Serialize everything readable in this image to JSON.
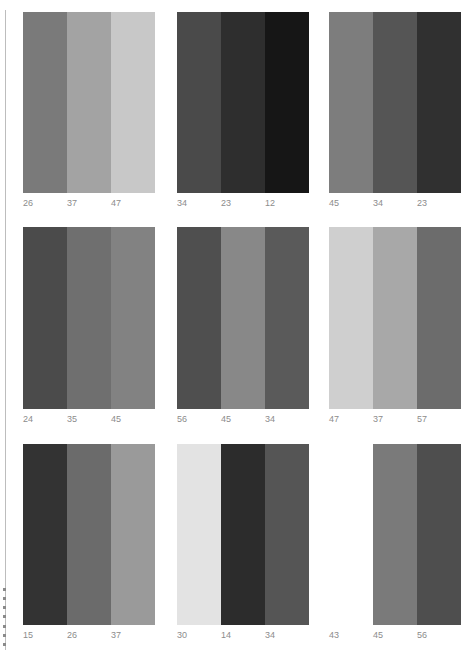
{
  "page": {
    "side_marker": "vertical page tab marker"
  },
  "rows": [
    {
      "panels": [
        {
          "colors": [
            "#7a7a7a",
            "#a3a3a3",
            "#c8c8c8"
          ],
          "labels": [
            "26",
            "37",
            "47"
          ]
        },
        {
          "colors": [
            "#4a4a4a",
            "#2e2e2e",
            "#161616"
          ],
          "labels": [
            "34",
            "23",
            "12"
          ]
        },
        {
          "colors": [
            "#7d7d7d",
            "#555555",
            "#303030"
          ],
          "labels": [
            "45",
            "34",
            "23"
          ]
        }
      ]
    },
    {
      "panels": [
        {
          "colors": [
            "#4b4b4b",
            "#6f6f6f",
            "#828282"
          ],
          "labels": [
            "24",
            "35",
            "45"
          ]
        },
        {
          "colors": [
            "#4f4f4f",
            "#888888",
            "#5a5a5a"
          ],
          "labels": [
            "56",
            "45",
            "34"
          ]
        },
        {
          "colors": [
            "#cfcfcf",
            "#a8a8a8",
            "#6c6c6c"
          ],
          "labels": [
            "47",
            "37",
            "57"
          ]
        }
      ]
    },
    {
      "panels": [
        {
          "colors": [
            "#333333",
            "#6b6b6b",
            "#9a9a9a"
          ],
          "labels": [
            "15",
            "26",
            "37"
          ]
        },
        {
          "colors": [
            "#e3e3e3",
            "#2c2c2c",
            "#555555"
          ],
          "labels": [
            "30",
            "14",
            "34"
          ]
        },
        {
          "colors": [
            "#ffffff",
            "#7a7a7a",
            "#4e4e4e"
          ],
          "labels": [
            "43",
            "45",
            "56"
          ]
        }
      ]
    }
  ]
}
